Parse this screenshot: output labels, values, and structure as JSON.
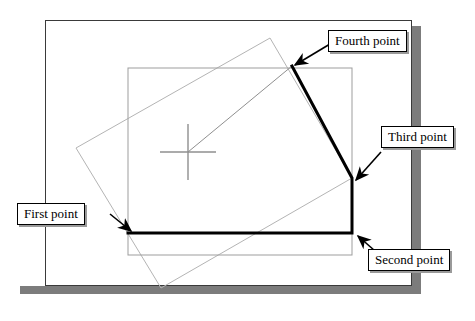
{
  "figure": {
    "kind": "cad-polyline-construction-diagram",
    "page": {
      "border_color": "#3a3a3a",
      "fill_color": "#ffffff",
      "shadow_color": "#7c7c7c"
    },
    "colors": {
      "guide_gray": "#9d9d9d",
      "guide_gray_light": "#b4b4b4",
      "polyline_black": "#000000",
      "crosshair_gray": "#8f8f8f",
      "callout_border": "#000000",
      "callout_fill": "#ffffff",
      "callout_shadow": "#9a9a9a"
    },
    "axis_rectangle": {
      "name": "reference-rectangle",
      "x": 128,
      "y": 68,
      "width": 224,
      "height": 187
    },
    "tilted_rectangle": {
      "name": "rotated-rectangle",
      "points": "76,148 270,38 352,178 161,288"
    },
    "polyline": {
      "name": "drawn-polyline",
      "points": "128,233 352,233 352,178 292,66",
      "stroke_width": 3
    },
    "leader_line": {
      "name": "crosshair-to-fourth-point",
      "x1": 188,
      "y1": 152,
      "x2": 292,
      "y2": 66
    },
    "crosshair": {
      "name": "cursor-crosshair",
      "cx": 188,
      "cy": 152,
      "half_width": 28,
      "half_height": 28
    },
    "points": [
      {
        "id": "first",
        "label": "First point",
        "x": 128,
        "y": 233
      },
      {
        "id": "second",
        "label": "Second point",
        "x": 352,
        "y": 233
      },
      {
        "id": "third",
        "label": "Third point",
        "x": 352,
        "y": 178
      },
      {
        "id": "fourth",
        "label": "Fourth point",
        "x": 292,
        "y": 66
      }
    ],
    "arrows": [
      {
        "id": "first-arrow",
        "x1": 110,
        "y1": 214,
        "x2": 131,
        "y2": 231
      },
      {
        "id": "second-arrow",
        "x1": 383,
        "y1": 258,
        "x2": 358,
        "y2": 236
      },
      {
        "id": "third-arrow",
        "x1": 381,
        "y1": 152,
        "x2": 356,
        "y2": 180
      },
      {
        "id": "fourth-arrow",
        "x1": 330,
        "y1": 44,
        "x2": 295,
        "y2": 65
      }
    ]
  }
}
